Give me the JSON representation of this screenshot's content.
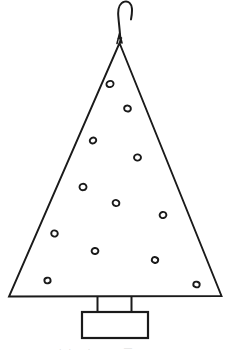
{
  "figure": {
    "background_color": "#FFFFFF",
    "ink_color": "#1A1A1A",
    "canvas": {
      "width": 227,
      "height": 352
    }
  },
  "labels": {
    "hook": "hanging-hook",
    "tree_body": "triangular-tree-outline",
    "trunk": "tree-trunk",
    "stand": "rectangular-base-stand",
    "ornaments_group": "ornament-cluster"
  },
  "geometry": {
    "hook": {
      "path": "M 120.5 42.5 C 120.2 32.0 118.6 22.0 118.2 14.5 C 117.9 7.5 120.5 2.6 124.6 1.6 C 128.6 0.7 131.4 3.6 131.9 8.4 C 132.3 12.2 131.6 16.2 131.0 19.4",
      "stroke_width": 2.0
    },
    "triangle": {
      "apex": {
        "x": 119.5,
        "y": 43.0
      },
      "base_left": {
        "x": 9.0,
        "y": 296.5
      },
      "base_right": {
        "x": 221.5,
        "y": 296.0
      },
      "stroke_width": 1.9
    },
    "apex_tuft": {
      "path": "M 117.0 43.5 L 119.5 33.5 L 122.0 43.0 M 118.0 38.5 L 121.5 38.0",
      "stroke_width": 1.6
    },
    "trunk": {
      "left_x": 97.5,
      "right_x": 131.5,
      "top_y": 296.5,
      "bottom_y": 312.0,
      "stroke_width": 2.0
    },
    "stand": {
      "x": 82.0,
      "y": 312.0,
      "width": 66.0,
      "height": 26.0,
      "stroke_width": 2.2
    }
  },
  "ornaments": {
    "count": 13,
    "fill": "none",
    "stroke_width": 1.9,
    "items": [
      {
        "id": "ornament-1",
        "cx": 110.0,
        "cy": 84.0,
        "rx": 3.6,
        "ry": 3.1,
        "rot": -18
      },
      {
        "id": "ornament-2",
        "cx": 127.5,
        "cy": 108.5,
        "rx": 3.4,
        "ry": 3.0,
        "rot": 12
      },
      {
        "id": "ornament-3",
        "cx": 93.0,
        "cy": 140.5,
        "rx": 3.3,
        "ry": 2.9,
        "rot": -24
      },
      {
        "id": "ornament-4",
        "cx": 137.5,
        "cy": 157.5,
        "rx": 3.5,
        "ry": 3.1,
        "rot": 8
      },
      {
        "id": "ornament-5",
        "cx": 83.0,
        "cy": 187.0,
        "rx": 3.5,
        "ry": 3.2,
        "rot": -10
      },
      {
        "id": "ornament-6",
        "cx": 116.0,
        "cy": 203.0,
        "rx": 3.4,
        "ry": 3.0,
        "rot": 15
      },
      {
        "id": "ornament-7",
        "cx": 163.0,
        "cy": 215.0,
        "rx": 3.4,
        "ry": 3.1,
        "rot": -14
      },
      {
        "id": "ornament-8",
        "cx": 54.5,
        "cy": 233.5,
        "rx": 3.3,
        "ry": 3.1,
        "rot": 20
      },
      {
        "id": "ornament-9",
        "cx": 95.0,
        "cy": 251.0,
        "rx": 3.4,
        "ry": 3.0,
        "rot": -8
      },
      {
        "id": "ornament-10",
        "cx": 155.0,
        "cy": 260.0,
        "rx": 3.2,
        "ry": 2.9,
        "rot": 16
      },
      {
        "id": "ornament-11",
        "cx": 47.5,
        "cy": 280.5,
        "rx": 3.1,
        "ry": 2.8,
        "rot": -12
      },
      {
        "id": "ornament-12",
        "cx": 196.5,
        "cy": 284.5,
        "rx": 3.2,
        "ry": 2.8,
        "rot": 10
      },
      {
        "id": "ornament-13",
        "cx": 188.0,
        "cy": 278.5,
        "rx": 0.0,
        "ry": 0.0,
        "rot": 0
      }
    ]
  },
  "caption": {
    "text": "   .   .       .              —",
    "note": "clipped caption text at bottom edge (illegible)"
  }
}
